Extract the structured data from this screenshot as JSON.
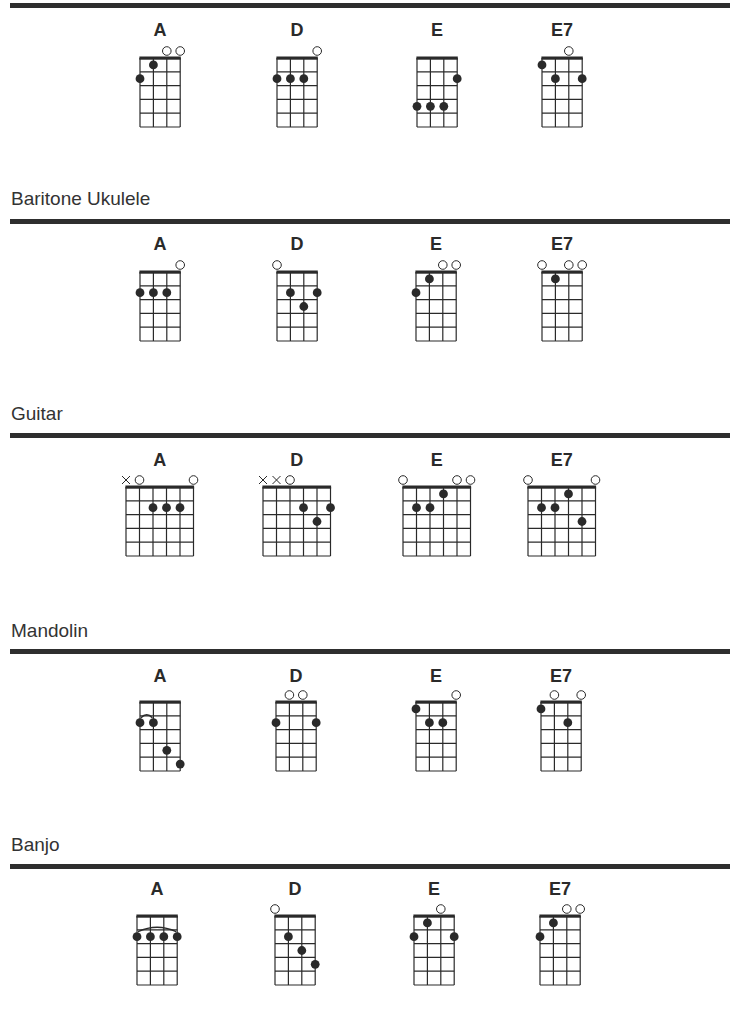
{
  "colors": {
    "ink": "#2a2a2a",
    "rule": "#2e2e2e",
    "background": "#ffffff"
  },
  "sections": [
    {
      "id": "ukulele",
      "title": "",
      "title_y": null,
      "rule_y": 3,
      "strings": 4,
      "frets": 5,
      "chords": [
        {
          "name": "A",
          "x": 140,
          "y": 58,
          "label_y": 20,
          "open": [
            3,
            4
          ],
          "muted": [],
          "dots": [
            [
              2,
              1
            ],
            [
              1,
              2
            ]
          ],
          "slur": null
        },
        {
          "name": "D",
          "x": 277,
          "y": 58,
          "label_y": 20,
          "open": [
            4
          ],
          "muted": [],
          "dots": [
            [
              1,
              2
            ],
            [
              2,
              2
            ],
            [
              3,
              2
            ]
          ],
          "slur": null
        },
        {
          "name": "E",
          "x": 417,
          "y": 58,
          "label_y": 20,
          "open": [],
          "muted": [],
          "dots": [
            [
              4,
              2
            ],
            [
              1,
              4
            ],
            [
              2,
              4
            ],
            [
              3,
              4
            ]
          ],
          "slur": null
        },
        {
          "name": "E7",
          "x": 542,
          "y": 58,
          "label_y": 20,
          "open": [
            3
          ],
          "muted": [],
          "dots": [
            [
              1,
              1
            ],
            [
              2,
              2
            ],
            [
              4,
              2
            ]
          ],
          "slur": null
        }
      ]
    },
    {
      "id": "baritone-ukulele",
      "title": "Baritone Ukulele",
      "title_y": 188,
      "rule_y": 219,
      "strings": 4,
      "frets": 5,
      "chords": [
        {
          "name": "A",
          "x": 140,
          "y": 272,
          "label_y": 234,
          "open": [
            4
          ],
          "muted": [],
          "dots": [
            [
              1,
              2
            ],
            [
              2,
              2
            ],
            [
              3,
              2
            ]
          ],
          "slur": null
        },
        {
          "name": "D",
          "x": 277,
          "y": 272,
          "label_y": 234,
          "open": [
            1
          ],
          "muted": [],
          "dots": [
            [
              2,
              2
            ],
            [
              4,
              2
            ],
            [
              3,
              3
            ]
          ],
          "slur": null
        },
        {
          "name": "E",
          "x": 416,
          "y": 272,
          "label_y": 234,
          "open": [
            3,
            4
          ],
          "muted": [],
          "dots": [
            [
              2,
              1
            ],
            [
              1,
              2
            ]
          ],
          "slur": null
        },
        {
          "name": "E7",
          "x": 542,
          "y": 272,
          "label_y": 234,
          "open": [
            1,
            3,
            4
          ],
          "muted": [],
          "dots": [
            [
              2,
              1
            ]
          ],
          "slur": null
        }
      ]
    },
    {
      "id": "guitar",
      "title": "Guitar",
      "title_y": 403,
      "rule_y": 433,
      "strings": 6,
      "frets": 5,
      "chords": [
        {
          "name": "A",
          "x": 126,
          "y": 487,
          "label_y": 450,
          "open": [
            2,
            6
          ],
          "muted": [
            1
          ],
          "dots": [
            [
              3,
              2
            ],
            [
              4,
              2
            ],
            [
              5,
              2
            ]
          ],
          "slur": null
        },
        {
          "name": "D",
          "x": 263,
          "y": 487,
          "label_y": 450,
          "open": [
            3
          ],
          "muted": [
            1,
            2
          ],
          "dots": [
            [
              4,
              2
            ],
            [
              6,
              2
            ],
            [
              5,
              3
            ]
          ],
          "slur": null
        },
        {
          "name": "E",
          "x": 403,
          "y": 487,
          "label_y": 450,
          "open": [
            1,
            5,
            6
          ],
          "muted": [],
          "dots": [
            [
              4,
              1
            ],
            [
              2,
              2
            ],
            [
              3,
              2
            ]
          ],
          "slur": null
        },
        {
          "name": "E7",
          "x": 528,
          "y": 487,
          "label_y": 450,
          "open": [
            1,
            6
          ],
          "muted": [],
          "dots": [
            [
              4,
              1
            ],
            [
              2,
              2
            ],
            [
              3,
              2
            ],
            [
              5,
              3
            ]
          ],
          "slur": null
        }
      ]
    },
    {
      "id": "mandolin",
      "title": "Mandolin",
      "title_y": 620,
      "rule_y": 649,
      "strings": 4,
      "frets": 5,
      "chords": [
        {
          "name": "A",
          "x": 140,
          "y": 702,
          "label_y": 666,
          "open": [],
          "muted": [],
          "dots": [
            [
              1,
              2
            ],
            [
              2,
              2
            ],
            [
              3,
              4
            ],
            [
              4,
              5
            ]
          ],
          "slur": {
            "from": 1,
            "to": 2,
            "fret": 2,
            "size": "small"
          }
        },
        {
          "name": "D",
          "x": 276,
          "y": 702,
          "label_y": 666,
          "open": [
            2,
            3
          ],
          "muted": [],
          "dots": [
            [
              1,
              2
            ],
            [
              4,
              2
            ]
          ],
          "slur": null
        },
        {
          "name": "E",
          "x": 416,
          "y": 702,
          "label_y": 666,
          "open": [
            4
          ],
          "muted": [],
          "dots": [
            [
              1,
              1
            ],
            [
              2,
              2
            ],
            [
              3,
              2
            ]
          ],
          "slur": null
        },
        {
          "name": "E7",
          "x": 541,
          "y": 702,
          "label_y": 666,
          "open": [
            2,
            4
          ],
          "muted": [],
          "dots": [
            [
              1,
              1
            ],
            [
              3,
              2
            ]
          ],
          "slur": null
        }
      ]
    },
    {
      "id": "banjo",
      "title": "Banjo",
      "title_y": 834,
      "rule_y": 864,
      "strings": 4,
      "frets": 5,
      "chords": [
        {
          "name": "A",
          "x": 137,
          "y": 916,
          "label_y": 879,
          "open": [],
          "muted": [],
          "dots": [
            [
              1,
              2
            ],
            [
              2,
              2
            ],
            [
              3,
              2
            ],
            [
              4,
              2
            ]
          ],
          "slur": {
            "from": 1,
            "to": 4,
            "fret": 2,
            "size": "large"
          }
        },
        {
          "name": "D",
          "x": 275,
          "y": 916,
          "label_y": 879,
          "open": [
            1
          ],
          "muted": [],
          "dots": [
            [
              2,
              2
            ],
            [
              3,
              3
            ],
            [
              4,
              4
            ]
          ],
          "slur": null
        },
        {
          "name": "E",
          "x": 414,
          "y": 916,
          "label_y": 879,
          "open": [
            3
          ],
          "muted": [],
          "dots": [
            [
              2,
              1
            ],
            [
              1,
              2
            ],
            [
              4,
              2
            ]
          ],
          "slur": null
        },
        {
          "name": "E7",
          "x": 540,
          "y": 916,
          "label_y": 879,
          "open": [
            3,
            4
          ],
          "muted": [],
          "dots": [
            [
              2,
              1
            ],
            [
              1,
              2
            ]
          ],
          "slur": null
        }
      ]
    }
  ]
}
